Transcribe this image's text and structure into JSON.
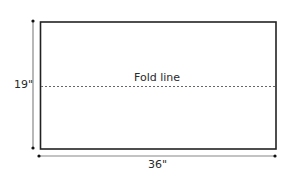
{
  "diagram": {
    "height_label": "19\"",
    "width_label": "36\"",
    "fold_label": "Fold line",
    "colors": {
      "outline": "#222222",
      "dimension_line": "#888888",
      "fold_line": "#666666",
      "text": "#2a2a2a"
    }
  }
}
